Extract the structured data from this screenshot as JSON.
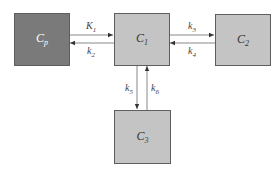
{
  "diagram": {
    "type": "compartment-model",
    "colors": {
      "plasma_fill": "#7a7a7a",
      "tissue_fill": "#c4c4c4",
      "border": "#5e5e5e",
      "arrow": "#777777"
    },
    "compartments": [
      {
        "id": "Cp",
        "base": "C",
        "sub": "p",
        "fill": "dark"
      },
      {
        "id": "C1",
        "base": "C",
        "sub": "1",
        "fill": "light"
      },
      {
        "id": "C2",
        "base": "C",
        "sub": "2",
        "fill": "light"
      },
      {
        "id": "C3",
        "base": "C",
        "sub": "3",
        "fill": "light"
      }
    ],
    "rates": [
      {
        "id": "K1",
        "base": "K",
        "sub": "1",
        "from": "Cp",
        "to": "C1"
      },
      {
        "id": "k2",
        "base": "k",
        "sub": "2",
        "from": "C1",
        "to": "Cp"
      },
      {
        "id": "k3",
        "base": "k",
        "sub": "3",
        "from": "C1",
        "to": "C2"
      },
      {
        "id": "k4",
        "base": "k",
        "sub": "4",
        "from": "C2",
        "to": "C1"
      },
      {
        "id": "k5",
        "base": "k",
        "sub": "5",
        "from": "C1",
        "to": "C3"
      },
      {
        "id": "k6",
        "base": "k",
        "sub": "6",
        "from": "C3",
        "to": "C1"
      }
    ]
  }
}
